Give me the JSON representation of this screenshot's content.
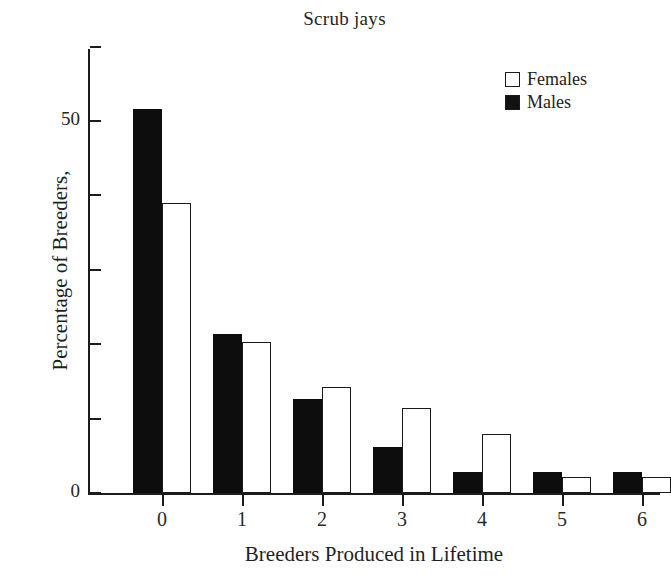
{
  "chart_data": {
    "type": "bar",
    "title": "Scrub jays",
    "xlabel": "Breeders Produced in Lifetime",
    "ylabel": "Percentage of Breeders,",
    "categories": [
      "0",
      "1",
      "2",
      "3",
      "4",
      "5",
      "6"
    ],
    "series": [
      {
        "name": "Females",
        "color": "#ffffff",
        "values": [
          39.0,
          20.3,
          14.2,
          11.4,
          7.9,
          2.2,
          2.2
        ]
      },
      {
        "name": "Males",
        "color": "#111111",
        "values": [
          51.6,
          21.4,
          12.6,
          6.2,
          2.8,
          2.8,
          2.8
        ]
      }
    ],
    "ylim": [
      0,
      60
    ],
    "yticks": [
      0,
      10,
      20,
      30,
      40,
      50,
      60
    ],
    "ytick_labels": [
      "0",
      "",
      "",
      "",
      "",
      "50",
      ""
    ],
    "grid": false,
    "legend_position": "top-right",
    "legend_entries": [
      "Females",
      "Males"
    ]
  },
  "axes": {
    "y_label_zero": "0",
    "y_label_fifty": "50"
  }
}
